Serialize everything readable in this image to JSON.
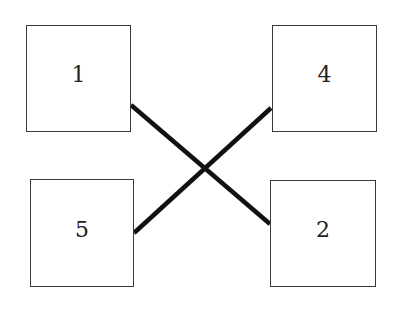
{
  "diagram": {
    "nodes": [
      {
        "id": "1",
        "label": "1",
        "x": 26,
        "y": 25,
        "w": 105,
        "h": 107
      },
      {
        "id": "4",
        "label": "4",
        "x": 272,
        "y": 25,
        "w": 105,
        "h": 107
      },
      {
        "id": "5",
        "label": "5",
        "x": 30,
        "y": 179,
        "w": 104,
        "h": 108
      },
      {
        "id": "2",
        "label": "2",
        "x": 270,
        "y": 180,
        "w": 106,
        "h": 107
      }
    ],
    "edges": [
      {
        "from": "1",
        "to": "2"
      },
      {
        "from": "5",
        "to": "4"
      }
    ]
  }
}
